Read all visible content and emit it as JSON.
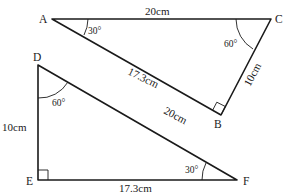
{
  "diagram": {
    "triangle_abc": {
      "vertices": {
        "A": "A",
        "B": "B",
        "C": "C"
      },
      "sides": {
        "AC": "20cm",
        "AB": "17.3cm",
        "BC": "10cm"
      },
      "angles": {
        "A": "30°",
        "C": "60°"
      }
    },
    "triangle_def": {
      "vertices": {
        "D": "D",
        "E": "E",
        "F": "F"
      },
      "sides": {
        "DF": "20cm",
        "EF": "17.3cm",
        "DE": "10cm"
      },
      "angles": {
        "D": "60°",
        "F": "30°"
      }
    }
  }
}
